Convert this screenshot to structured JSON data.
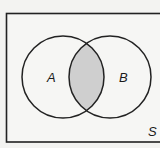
{
  "diagram": {
    "type": "venn",
    "universe": {
      "label": "S"
    },
    "sets": [
      {
        "id": "A",
        "label": "A"
      },
      {
        "id": "B",
        "label": "B"
      }
    ],
    "shaded_region": "A ∩ B",
    "colors": {
      "background": "#f3f3f1",
      "universe_fill": "#f6f6f4",
      "stroke": "#222222",
      "shade": "#cfcfcf"
    }
  }
}
